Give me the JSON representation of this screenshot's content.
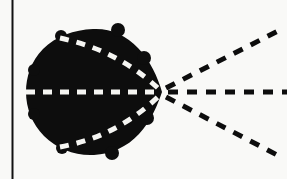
{
  "figure": {
    "title": "Converging and diverging dashed rays through a filled lobe region",
    "background_color": "#f9f9f7",
    "ink_color": "#0d0d0d",
    "dash_light_color": "#f5f5f2",
    "canvas": {
      "width": 287,
      "height": 179
    },
    "axis": {
      "name": "vertical-axis-line",
      "orientation": "vertical",
      "x": 12,
      "y_top": 0,
      "y_bottom": 179,
      "thickness": 2,
      "color": "#111111"
    },
    "lobe": {
      "name": "filled-lobe-region",
      "fill_color": "#0d0d0d",
      "left_extent_x": 26,
      "right_apex_x": 162,
      "top_extent_y": 29,
      "bottom_extent_y": 156,
      "center_y": 92,
      "description": "rounded teardrop / cardioid-like blob, broad on the left, tapering to a point on the right"
    },
    "focal_point": {
      "name": "convergence-point",
      "x": 162,
      "y": 92,
      "label": ""
    },
    "rays": [
      {
        "name": "ray-inner-upper",
        "style": "dashed",
        "color": "#f5f5f2",
        "inside_lobe": true,
        "start": {
          "x": 60,
          "y": 38
        },
        "end": {
          "x": 160,
          "y": 90
        },
        "curved": true
      },
      {
        "name": "ray-inner-axis",
        "style": "dashed",
        "color": "#f5f5f2",
        "inside_lobe": true,
        "start": {
          "x": 27,
          "y": 92
        },
        "end": {
          "x": 160,
          "y": 92
        },
        "curved": false
      },
      {
        "name": "ray-inner-lower",
        "style": "dashed",
        "color": "#f5f5f2",
        "inside_lobe": true,
        "start": {
          "x": 60,
          "y": 147
        },
        "end": {
          "x": 160,
          "y": 95
        },
        "curved": true
      },
      {
        "name": "ray-outer-upper",
        "style": "dashed",
        "color": "#0d0d0d",
        "inside_lobe": false,
        "start": {
          "x": 166,
          "y": 88
        },
        "end": {
          "x": 278,
          "y": 31
        },
        "curved": false
      },
      {
        "name": "ray-outer-axis",
        "style": "dashed",
        "color": "#0d0d0d",
        "inside_lobe": false,
        "start": {
          "x": 168,
          "y": 92
        },
        "end": {
          "x": 287,
          "y": 92
        },
        "curved": false
      },
      {
        "name": "ray-outer-lower",
        "style": "dashed",
        "color": "#0d0d0d",
        "inside_lobe": false,
        "start": {
          "x": 166,
          "y": 97
        },
        "end": {
          "x": 281,
          "y": 157
        },
        "curved": false
      }
    ],
    "dash_pattern": {
      "outer_dash_length": 10,
      "outer_gap_length": 9,
      "outer_stroke_width": 5,
      "inner_dash_length": 9,
      "inner_gap_length": 8,
      "inner_stroke_width": 5
    }
  }
}
